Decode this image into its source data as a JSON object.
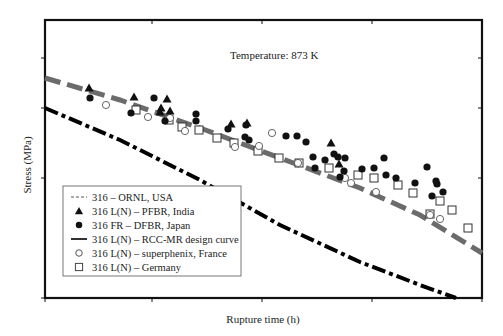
{
  "chart_data": {
    "type": "scatter",
    "title": "",
    "annotation": "Temperature: 873 K",
    "xlabel": "Rupture time (h)",
    "ylabel": "Stress (MPa)",
    "x_tick_labels": [],
    "y_tick_labels": [],
    "grid": false,
    "legend_position": "lower-left",
    "plot_box": {
      "left": 45,
      "right": 482,
      "top": 20,
      "bottom": 298
    },
    "x_ticks_px": [
      45,
      152,
      262,
      372,
      482
    ],
    "y_ticks_px": [
      58,
      108,
      178,
      298
    ],
    "series": [
      {
        "name": "316 – ORNL, USA",
        "kind": "line",
        "style": "dashed",
        "color": "#6b6b6b",
        "points_px": [
          [
            45,
            78
          ],
          [
            120,
            100
          ],
          [
            200,
            128
          ],
          [
            280,
            158
          ],
          [
            360,
            188
          ],
          [
            420,
            215
          ],
          [
            482,
            253
          ]
        ]
      },
      {
        "name": "316 L(N) – PFBR, India",
        "kind": "marker",
        "marker": "triangle-filled",
        "color": "#111111",
        "points_px": [
          [
            89,
            88
          ],
          [
            134,
            97
          ],
          [
            161,
            108
          ],
          [
            167,
            99
          ],
          [
            160,
            112
          ],
          [
            170,
            111
          ],
          [
            231,
            124
          ],
          [
            247,
            123
          ],
          [
            331,
            143
          ],
          [
            339,
            164
          ]
        ]
      },
      {
        "name": "316 FR – DFBR, Japan",
        "kind": "marker",
        "marker": "circle-filled",
        "color": "#111111",
        "points_px": [
          [
            90,
            98
          ],
          [
            131,
            113
          ],
          [
            154,
            98
          ],
          [
            165,
            121
          ],
          [
            196,
            114
          ],
          [
            196,
            121
          ],
          [
            228,
            129
          ],
          [
            246,
            125
          ],
          [
            245,
            137
          ],
          [
            249,
            140
          ],
          [
            286,
            136
          ],
          [
            297,
            136
          ],
          [
            306,
            142
          ],
          [
            313,
            157
          ],
          [
            325,
            160
          ],
          [
            315,
            168
          ],
          [
            334,
            154
          ],
          [
            338,
            157
          ],
          [
            340,
            177
          ],
          [
            344,
            171
          ],
          [
            345,
            158
          ],
          [
            362,
            169
          ],
          [
            374,
            168
          ],
          [
            384,
            158
          ],
          [
            386,
            175
          ],
          [
            396,
            178
          ],
          [
            415,
            183
          ],
          [
            427,
            167
          ],
          [
            437,
            184
          ],
          [
            443,
            192
          ],
          [
            432,
            196
          ],
          [
            436,
            181
          ]
        ]
      },
      {
        "name": "316 L(N) – RCC-MR design curve",
        "kind": "line",
        "style": "dash-dot",
        "color": "#000000",
        "points_px": [
          [
            45,
            108
          ],
          [
            120,
            140
          ],
          [
            200,
            180
          ],
          [
            280,
            225
          ],
          [
            360,
            262
          ],
          [
            420,
            285
          ],
          [
            456,
            298
          ]
        ]
      },
      {
        "name": "316 L(N) – superphenix, France",
        "kind": "marker",
        "marker": "circle-open",
        "color": "#555555",
        "points_px": [
          [
            106,
            105
          ],
          [
            148,
            117
          ],
          [
            170,
            118
          ],
          [
            185,
            131
          ],
          [
            235,
            147
          ],
          [
            259,
            146
          ],
          [
            272,
            133
          ],
          [
            298,
            163
          ],
          [
            345,
            178
          ],
          [
            351,
            183
          ],
          [
            376,
            192
          ],
          [
            430,
            215
          ],
          [
            440,
            219
          ]
        ]
      },
      {
        "name": "316 L(N) – Germany",
        "kind": "marker",
        "marker": "square-open",
        "color": "#333333",
        "points_px": [
          [
            136,
            110
          ],
          [
            169,
            120
          ],
          [
            182,
            127
          ],
          [
            199,
            130
          ],
          [
            217,
            138
          ],
          [
            234,
            143
          ],
          [
            258,
            151
          ],
          [
            279,
            158
          ],
          [
            299,
            163
          ],
          [
            329,
            168
          ],
          [
            358,
            175
          ],
          [
            374,
            178
          ],
          [
            398,
            185
          ],
          [
            413,
            193
          ],
          [
            440,
            201
          ],
          [
            452,
            210
          ],
          [
            430,
            214
          ],
          [
            468,
            228
          ]
        ]
      }
    ]
  },
  "figure": {
    "annotation": "Temperature: 873 K",
    "xlabel": "Rupture time (h)",
    "ylabel": "Stress (MPa)",
    "legend": [
      {
        "label": "316 – ORNL, USA",
        "symbol": "dashed-line"
      },
      {
        "label": "316 L(N) – PFBR, India",
        "symbol": "triangle-filled"
      },
      {
        "label": "316 FR – DFBR, Japan",
        "symbol": "circle-filled"
      },
      {
        "label": "316 L(N) – RCC-MR design curve",
        "symbol": "dash-dot-line"
      },
      {
        "label": "316 L(N) – superphenix, France",
        "symbol": "circle-open"
      },
      {
        "label": "316 L(N) – Germany",
        "symbol": "square-open"
      }
    ]
  }
}
